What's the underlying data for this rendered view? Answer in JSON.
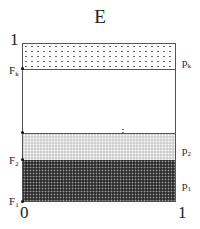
{
  "title": "E",
  "axes": {
    "y_top": "1",
    "x_left": "0",
    "x_right": "1"
  },
  "left_labels": [
    {
      "base": "F",
      "sub": "k"
    },
    {
      "base": "F",
      "sub": "2"
    },
    {
      "base": "F",
      "sub": "1"
    }
  ],
  "right_labels": [
    {
      "base": "p",
      "sub": "k"
    },
    {
      "base": "p",
      "sub": "2"
    },
    {
      "base": "p",
      "sub": "1"
    }
  ],
  "ellipsis": "⋮",
  "bands": [
    {
      "name": "p_k",
      "pattern": "sparse dots",
      "color": "#ffffff"
    },
    {
      "name": "gap",
      "pattern": "none",
      "color": "#ffffff"
    },
    {
      "name": "p_2",
      "pattern": "light stipple",
      "color": "#cfcfcf"
    },
    {
      "name": "p_1",
      "pattern": "dark stipple",
      "color": "#2c2c2c"
    }
  ]
}
